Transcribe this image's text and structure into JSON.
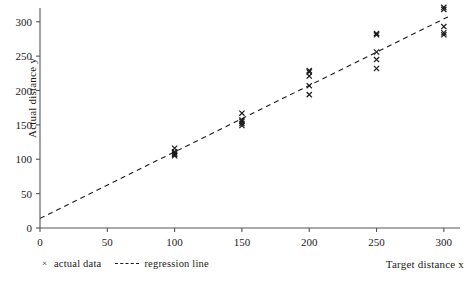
{
  "chart_data": {
    "type": "scatter",
    "title": "",
    "xlabel": "Target distance x",
    "ylabel": "Actual distance y",
    "xlim": [
      0,
      312
    ],
    "ylim": [
      0,
      320
    ],
    "xticks": [
      0,
      50,
      100,
      150,
      200,
      250,
      300
    ],
    "xticklabels": [
      "0",
      "50",
      "100",
      "150",
      "200",
      "250",
      "300"
    ],
    "yticks": [
      0,
      50,
      100,
      150,
      200,
      250,
      300
    ],
    "yticklabels": [
      "0",
      "50",
      "100",
      "150",
      "200",
      "250",
      "300"
    ],
    "grid": false,
    "legend_position": "below-axis-left",
    "series": [
      {
        "name": "actual data",
        "type": "scatter",
        "marker": "x",
        "color": "#1a1a1a",
        "points": [
          {
            "x": 100,
            "y": 116
          },
          {
            "x": 100,
            "y": 111
          },
          {
            "x": 100,
            "y": 109
          },
          {
            "x": 100,
            "y": 107
          },
          {
            "x": 100,
            "y": 105
          },
          {
            "x": 150,
            "y": 167
          },
          {
            "x": 150,
            "y": 157
          },
          {
            "x": 150,
            "y": 155
          },
          {
            "x": 150,
            "y": 152
          },
          {
            "x": 150,
            "y": 149
          },
          {
            "x": 200,
            "y": 229
          },
          {
            "x": 200,
            "y": 227
          },
          {
            "x": 200,
            "y": 221
          },
          {
            "x": 200,
            "y": 207
          },
          {
            "x": 200,
            "y": 194
          },
          {
            "x": 250,
            "y": 283
          },
          {
            "x": 250,
            "y": 281
          },
          {
            "x": 250,
            "y": 256
          },
          {
            "x": 250,
            "y": 245
          },
          {
            "x": 250,
            "y": 232
          },
          {
            "x": 300,
            "y": 321
          },
          {
            "x": 300,
            "y": 318
          },
          {
            "x": 300,
            "y": 293
          },
          {
            "x": 300,
            "y": 284
          },
          {
            "x": 300,
            "y": 281
          }
        ]
      },
      {
        "name": "regression line",
        "type": "line",
        "style": "dashed",
        "color": "#1a1a1a",
        "endpoints": [
          {
            "x": 0,
            "y": 14
          },
          {
            "x": 303,
            "y": 307
          }
        ],
        "slope": 0.967,
        "intercept": 14
      }
    ]
  },
  "legend": {
    "entries": [
      {
        "marker": "×",
        "label": "actual data"
      },
      {
        "marker": "dashed-line",
        "label": "regression line"
      }
    ]
  },
  "axes": {
    "x_title": "Target distance x",
    "y_title": "Actual distance y"
  }
}
